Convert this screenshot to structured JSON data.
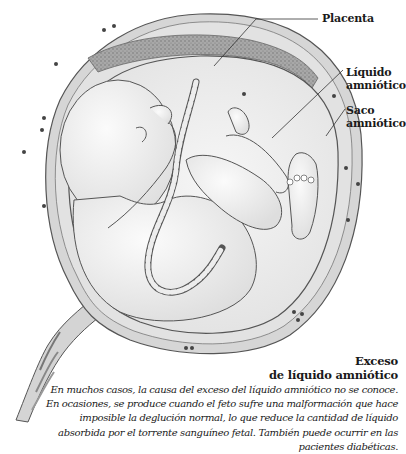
{
  "figure": {
    "labels": [
      {
        "id": "placenta",
        "text": "Placenta"
      },
      {
        "id": "liquido",
        "line1": "Líquido",
        "line2": "amniótico"
      },
      {
        "id": "saco",
        "line1": "Saco",
        "line2": "amniótico"
      }
    ]
  },
  "caption": {
    "title_line1": "Exceso",
    "title_line2": "de líquido amniótico",
    "body_lines": [
      "En muchos casos, la causa del exceso del líquido amniótico no se conoce.",
      "En ocasiones, se produce cuando el feto sufre una malformación que hace",
      "imposible la deglución normal, lo que reduce la cantidad de líquido",
      "absorbida por el torrente sanguíneo fetal. También puede ocurrir en las",
      "pacientes diabéticas."
    ]
  },
  "colors": {
    "line": "#555555",
    "uterus_wall": "#d6d6d6",
    "placenta": "#9a9a9a",
    "amniotic_fluid": "#ececec",
    "fetus": "#f4f4f4",
    "text": "#1a1a1a"
  }
}
